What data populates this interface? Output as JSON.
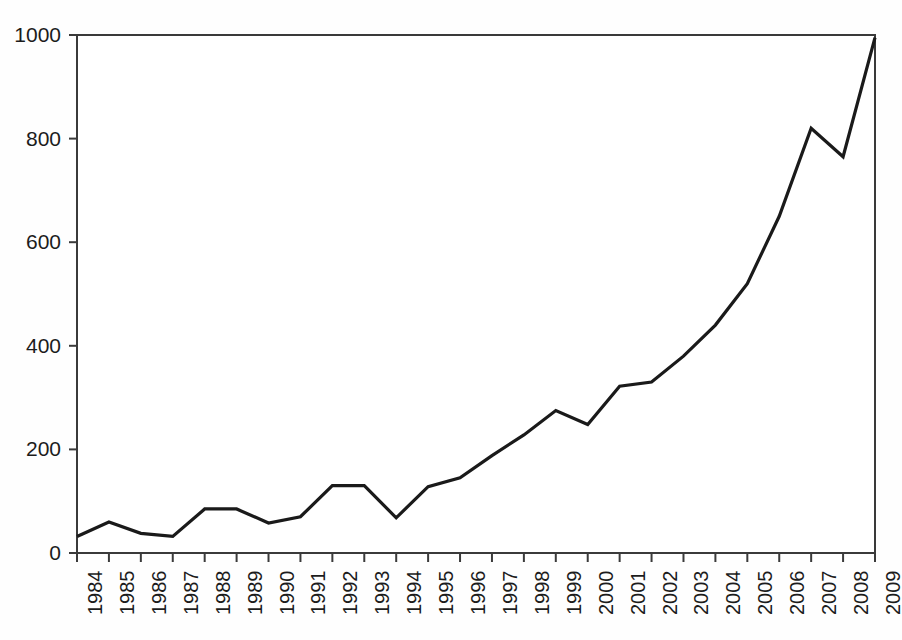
{
  "chart_data": {
    "type": "line",
    "title": "",
    "subtitle": "",
    "xlabel": "",
    "ylabel": "",
    "xlim": [
      1984,
      2009
    ],
    "ylim": [
      0,
      1000
    ],
    "grid": false,
    "legend": false,
    "legend_position": "none",
    "line_color": "#1a1a1a",
    "background_color": "#ffffff",
    "axis_color": "#3a3a3a",
    "x_tick_labels": [
      "1984",
      "1985",
      "1986",
      "1987",
      "1988",
      "1989",
      "1990",
      "1991",
      "1992",
      "1993",
      "1994",
      "1995",
      "1996",
      "1997",
      "1998",
      "1999",
      "2000",
      "2001",
      "2002",
      "2003",
      "2004",
      "2005",
      "2006",
      "2007",
      "2008",
      "2009"
    ],
    "y_tick_labels": [
      "0",
      "200",
      "400",
      "600",
      "800",
      "1000"
    ],
    "y_ticks": [
      0,
      200,
      400,
      600,
      800,
      1000
    ],
    "x_tick_rotation": 90,
    "categories": [
      1984,
      1985,
      1986,
      1987,
      1988,
      1989,
      1990,
      1991,
      1992,
      1993,
      1994,
      1995,
      1996,
      1997,
      1998,
      1999,
      2000,
      2001,
      2002,
      2003,
      2004,
      2005,
      2006,
      2007,
      2008,
      2009
    ],
    "values": [
      32,
      60,
      38,
      32,
      85,
      85,
      58,
      70,
      130,
      130,
      68,
      128,
      145,
      188,
      228,
      275,
      248,
      322,
      330,
      380,
      440,
      520,
      650,
      820,
      765,
      995
    ],
    "series": [
      {
        "name": "series-1",
        "color": "#1a1a1a",
        "values": [
          32,
          60,
          38,
          32,
          85,
          85,
          58,
          70,
          130,
          130,
          68,
          128,
          145,
          188,
          228,
          275,
          248,
          322,
          330,
          380,
          440,
          520,
          650,
          820,
          765,
          995
        ]
      }
    ]
  }
}
